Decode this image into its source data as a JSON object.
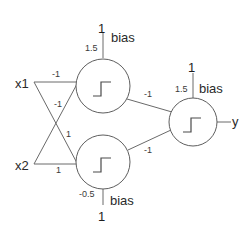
{
  "diagram": {
    "type": "neural-network-perceptron",
    "inputs": [
      {
        "id": "x1",
        "label": "x1"
      },
      {
        "id": "x2",
        "label": "x2"
      }
    ],
    "hidden_neurons": [
      {
        "id": "h1",
        "activation_icon": "step-function",
        "bias_label": "bias",
        "bias_input": "1",
        "bias_weight": "1.5"
      },
      {
        "id": "h2",
        "activation_icon": "step-function",
        "bias_label": "bias",
        "bias_input": "1",
        "bias_weight": "-0.5"
      }
    ],
    "output_neuron": {
      "id": "out",
      "activation_icon": "step-function",
      "bias_label": "bias",
      "bias_input": "1",
      "bias_weight": "1.5",
      "output_label": "y"
    },
    "weights": {
      "x1_h1": "-1",
      "x2_h1": "-1",
      "x1_h2": "1",
      "x2_h2": "1",
      "h1_out": "-1",
      "h2_out": "-1"
    },
    "colors": {
      "line": "#6a6a6a",
      "text": "#2a2a2a",
      "background": "#ffffff"
    }
  }
}
